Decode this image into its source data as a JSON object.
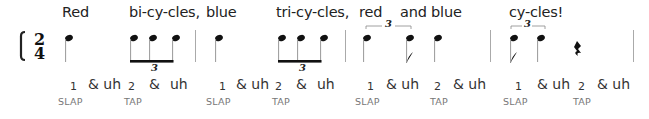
{
  "time_signature": {
    "top": "2",
    "bottom": "4"
  },
  "lyrics": [
    {
      "text": "Red",
      "x": 62
    },
    {
      "text": "bi-cy-cles,",
      "x": 129
    },
    {
      "text": "blue",
      "x": 206
    },
    {
      "text": "tri-cy-cles,",
      "x": 276
    },
    {
      "text": "red",
      "x": 359
    },
    {
      "text": "and blue",
      "x": 400
    },
    {
      "text": "cy-cles!",
      "x": 509
    }
  ],
  "tuplet_labels": {
    "triplet": "3"
  },
  "counts": [
    {
      "text": "1",
      "x": 70,
      "num": true
    },
    {
      "text": "& uh",
      "x": 88
    },
    {
      "text": "2",
      "x": 128,
      "num": true
    },
    {
      "text": "&",
      "x": 149
    },
    {
      "text": "uh",
      "x": 170
    },
    {
      "text": "1",
      "x": 219,
      "num": true
    },
    {
      "text": "& uh",
      "x": 236
    },
    {
      "text": "2",
      "x": 275,
      "num": true
    },
    {
      "text": "&",
      "x": 296
    },
    {
      "text": "uh",
      "x": 317
    },
    {
      "text": "1",
      "x": 367,
      "num": true
    },
    {
      "text": "& uh",
      "x": 386
    },
    {
      "text": "2",
      "x": 434,
      "num": true
    },
    {
      "text": "& uh",
      "x": 453
    },
    {
      "text": "1",
      "x": 515,
      "num": true
    },
    {
      "text": "& uh",
      "x": 537
    },
    {
      "text": "2",
      "x": 578,
      "num": true
    },
    {
      "text": "& uh",
      "x": 597
    }
  ],
  "actions": [
    {
      "text": "SLAP",
      "x": 58
    },
    {
      "text": "TAP",
      "x": 124
    },
    {
      "text": "SLAP",
      "x": 206
    },
    {
      "text": "TAP",
      "x": 272
    },
    {
      "text": "SLAP",
      "x": 355
    },
    {
      "text": "TAP",
      "x": 430
    },
    {
      "text": "SLAP",
      "x": 503
    },
    {
      "text": "TAP",
      "x": 573
    }
  ],
  "colors": {
    "ink": "#111111",
    "stem": "#999999",
    "barline": "#aaaaaa",
    "text": "#222222",
    "action": "#777777"
  }
}
